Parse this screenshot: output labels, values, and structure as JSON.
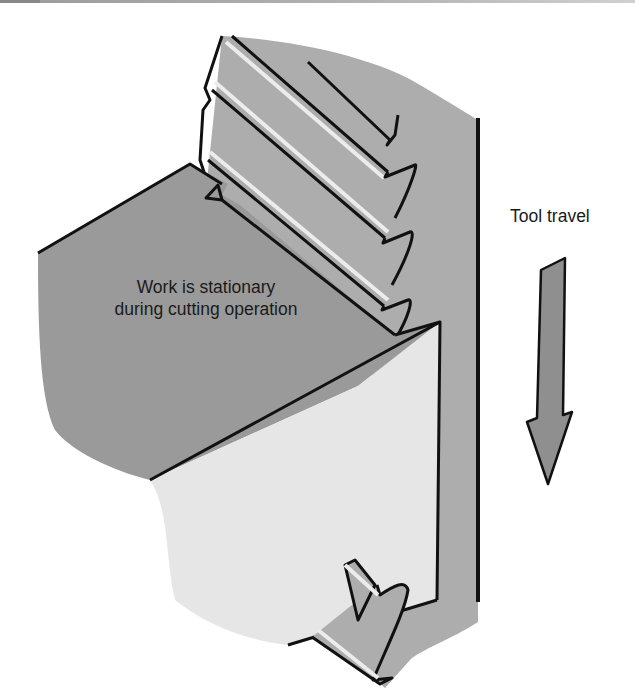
{
  "figure": {
    "work_label": {
      "line1": "Work is stationary",
      "line2": "during cutting operation"
    },
    "tool_travel_label": "Tool travel",
    "arrow_direction": "down",
    "colors": {
      "tool_body": "#adadad",
      "work_top": "#9a9a9a",
      "work_front": "#e6e6e6",
      "tooth_highlight": "#ececec",
      "outline": "#111111",
      "arrow_fill": "#8f8f8f",
      "background": "#ffffff"
    }
  }
}
